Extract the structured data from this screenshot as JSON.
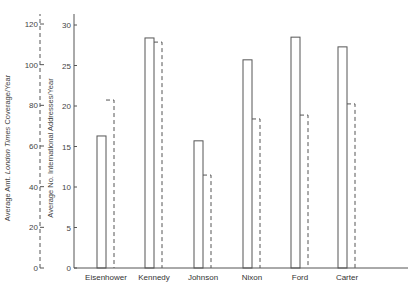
{
  "chart_data": {
    "type": "bar",
    "title": "",
    "categories": [
      "Eisenhower",
      "Kennedy",
      "Johnson",
      "Nixon",
      "Ford",
      "Carter"
    ],
    "series": [
      {
        "name": "Average No. International Addresses/Year",
        "style": "solid",
        "axis": "right-inner",
        "values": [
          16.3,
          28.4,
          15.7,
          25.7,
          28.5,
          27.3
        ]
      },
      {
        "name": "Average Amt. London Times Coverage/Year",
        "style": "dashed",
        "axis": "left-outer",
        "values": [
          82.6,
          111.1,
          45.7,
          73.3,
          75.2,
          80.7
        ]
      }
    ],
    "axes": {
      "left_outer": {
        "label_prefix": "Average Amt. ",
        "label_italic": "London Times",
        "label_suffix": " Coverage/Year",
        "ticks": [
          0,
          20,
          40,
          60,
          80,
          100,
          120
        ],
        "ylim": [
          0,
          120
        ],
        "line_style": "dashed"
      },
      "right_inner": {
        "label": "Average No. International Addresses/Year",
        "ticks": [
          0,
          5,
          10,
          15,
          20,
          25,
          30
        ],
        "ylim": [
          0,
          30
        ],
        "line_style": "solid"
      }
    },
    "xlabel": "",
    "grid": false,
    "legend": "none"
  }
}
